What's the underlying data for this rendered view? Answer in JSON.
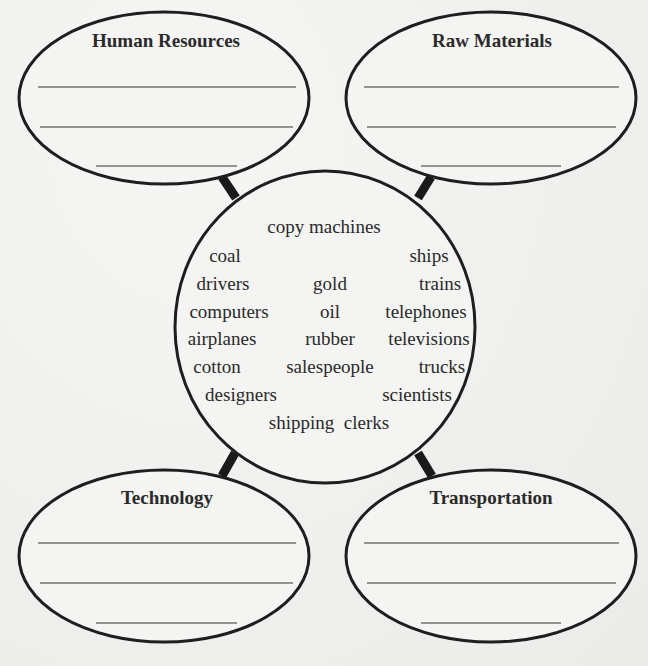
{
  "diagram": {
    "type": "concept-web",
    "center": {
      "words": [
        {
          "text": "copy machines",
          "x": 324,
          "y": 217
        },
        {
          "text": "coal",
          "x": 225,
          "y": 246
        },
        {
          "text": "ships",
          "x": 429,
          "y": 246
        },
        {
          "text": "drivers",
          "x": 223,
          "y": 274
        },
        {
          "text": "gold",
          "x": 330,
          "y": 274
        },
        {
          "text": "trains",
          "x": 440,
          "y": 274
        },
        {
          "text": "computers",
          "x": 229,
          "y": 302
        },
        {
          "text": "oil",
          "x": 330,
          "y": 302
        },
        {
          "text": "telephones",
          "x": 426,
          "y": 302
        },
        {
          "text": "airplanes",
          "x": 222,
          "y": 329
        },
        {
          "text": "rubber",
          "x": 330,
          "y": 329
        },
        {
          "text": "televisions",
          "x": 429,
          "y": 329
        },
        {
          "text": "cotton",
          "x": 217,
          "y": 357
        },
        {
          "text": "salespeople",
          "x": 330,
          "y": 357
        },
        {
          "text": "trucks",
          "x": 442,
          "y": 357
        },
        {
          "text": "designers",
          "x": 241,
          "y": 385
        },
        {
          "text": "scientists",
          "x": 417,
          "y": 385
        },
        {
          "text": "shipping  clerks",
          "x": 329,
          "y": 413
        }
      ]
    },
    "categories": [
      {
        "title": "Human Resources",
        "position": "top-left",
        "blank_lines": 3
      },
      {
        "title": "Raw Materials",
        "position": "top-right",
        "blank_lines": 3
      },
      {
        "title": "Technology",
        "position": "bottom-left",
        "blank_lines": 3
      },
      {
        "title": "Transportation",
        "position": "bottom-right",
        "blank_lines": 3
      }
    ]
  }
}
